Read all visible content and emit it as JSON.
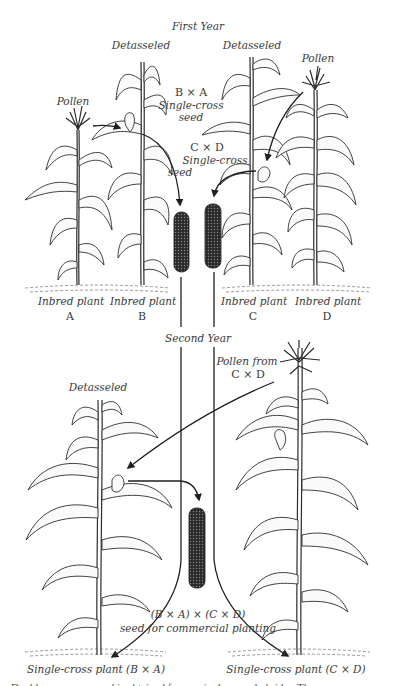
{
  "figure": {
    "sections": {
      "first_year": "First Year",
      "second_year": "Second Year"
    },
    "first_year": {
      "plants": [
        {
          "id": "A",
          "label": "Inbred plant",
          "letter": "A",
          "annotation": "Pollen"
        },
        {
          "id": "B",
          "label": "Inbred plant",
          "letter": "B",
          "annotation": "Detasseled"
        },
        {
          "id": "C",
          "label": "Inbred plant",
          "letter": "C",
          "annotation": "Detasseled"
        },
        {
          "id": "D",
          "label": "Inbred plant",
          "letter": "D",
          "annotation": "Pollen"
        }
      ],
      "seeds": [
        {
          "cross": "B × A",
          "line1": "Single-cross",
          "line2": "seed"
        },
        {
          "cross": "C × D",
          "line1": "Single-cross",
          "line2": "seed"
        }
      ]
    },
    "second_year": {
      "pollen_source": {
        "line1": "Pollen from",
        "line2": "C × D"
      },
      "detasseled_label": "Detasseled",
      "result": {
        "cross": "(B × A) × (C × D)",
        "description": "seed for commercial planting"
      },
      "plants": [
        {
          "label": "Single-cross plant (B × A)"
        },
        {
          "label": "Single-cross plant (C × D)"
        }
      ]
    },
    "caption_partial": "... Double-cross corn seed is obtained from a single-cross hybrid ... The ... ",
    "colors": {
      "ink": "#2c2c2c",
      "label": "#3a3a3a",
      "background": "#ffffff",
      "cob": "#2a2a2a"
    }
  }
}
